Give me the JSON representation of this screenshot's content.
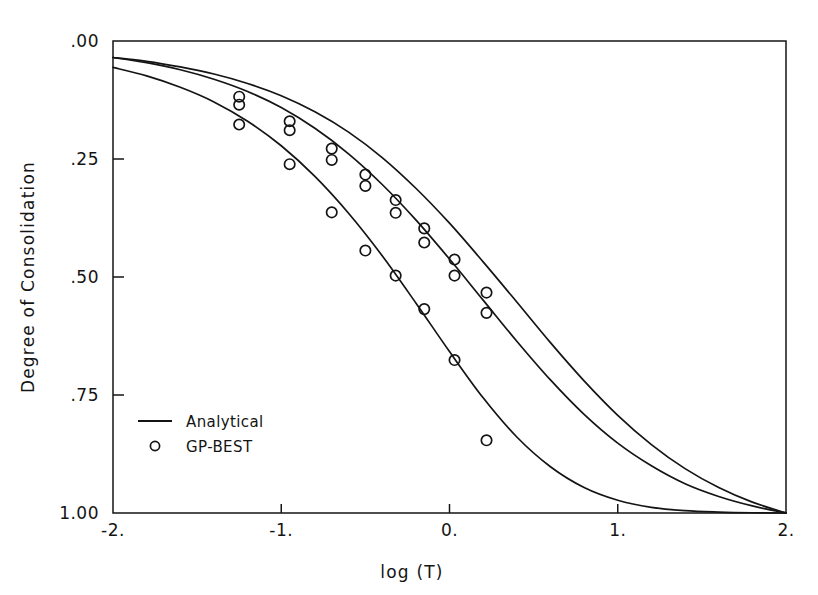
{
  "chart_data": {
    "type": "line",
    "title": "",
    "subtitle": "",
    "xlabel": "log (T)",
    "ylabel": "Degree of Consolidation",
    "xlim": [
      -2,
      2
    ],
    "ylim": [
      0,
      1
    ],
    "y_axis_inverted": true,
    "grid": false,
    "xticks": [
      -2,
      -1,
      0,
      1,
      2
    ],
    "xticklabels": [
      "-2.",
      "-1.",
      "0.",
      "1.",
      "2."
    ],
    "yticks": [
      0,
      0.25,
      0.5,
      0.75,
      1
    ],
    "yticklabels": [
      ".00",
      ".25",
      ".50",
      ".75",
      "1.00"
    ],
    "legend": {
      "position": "lower-left-inside",
      "entries": [
        {
          "label": "Analytical",
          "marker": "line"
        },
        {
          "label": "GP-BEST",
          "marker": "circle"
        }
      ]
    },
    "annotations": [],
    "series": [
      {
        "name": "Analytical",
        "kind": "line",
        "curve_index": 1,
        "x": [
          -2.0,
          -1.8,
          -1.6,
          -1.4,
          -1.2,
          -1.0,
          -0.8,
          -0.6,
          -0.4,
          -0.2,
          0.0,
          0.2,
          0.4,
          0.6,
          0.8,
          1.0,
          1.2,
          1.4,
          1.6,
          1.8,
          2.0
        ],
        "y": [
          0.035,
          0.046,
          0.061,
          0.081,
          0.107,
          0.141,
          0.185,
          0.239,
          0.304,
          0.379,
          0.462,
          0.549,
          0.636,
          0.718,
          0.791,
          0.852,
          0.9,
          0.938,
          0.965,
          0.985,
          1.0
        ]
      },
      {
        "name": "Analytical",
        "kind": "line",
        "curve_index": 2,
        "x": [
          -2.0,
          -1.8,
          -1.6,
          -1.4,
          -1.2,
          -1.0,
          -0.8,
          -0.6,
          -0.4,
          -0.2,
          0.0,
          0.2,
          0.4,
          0.6,
          0.8,
          1.0,
          1.2,
          1.4,
          1.6,
          1.8,
          2.0
        ],
        "y": [
          0.035,
          0.043,
          0.055,
          0.07,
          0.09,
          0.116,
          0.15,
          0.193,
          0.247,
          0.312,
          0.386,
          0.468,
          0.553,
          0.639,
          0.72,
          0.793,
          0.855,
          0.906,
          0.946,
          0.977,
          1.0
        ]
      },
      {
        "name": "Analytical",
        "kind": "line",
        "curve_index": 3,
        "x": [
          -2.0,
          -1.8,
          -1.6,
          -1.4,
          -1.2,
          -1.0,
          -0.8,
          -0.6,
          -0.4,
          -0.2,
          0.0,
          0.2,
          0.4,
          0.6,
          0.8,
          1.0,
          1.2,
          1.4,
          1.6,
          1.8,
          2.0
        ],
        "y": [
          0.056,
          0.074,
          0.098,
          0.129,
          0.17,
          0.222,
          0.287,
          0.365,
          0.455,
          0.555,
          0.658,
          0.756,
          0.839,
          0.902,
          0.946,
          0.973,
          0.988,
          0.995,
          0.998,
          0.9995,
          1.0
        ]
      },
      {
        "name": "GP-BEST",
        "kind": "scatter",
        "curve_index": 1,
        "x": [
          -1.25,
          -0.95,
          -0.7,
          -0.5,
          -0.32,
          -0.15,
          0.03,
          0.22
        ],
        "y": [
          0.118,
          0.17,
          0.228,
          0.283,
          0.337,
          0.397,
          0.463,
          0.533
        ]
      },
      {
        "name": "GP-BEST",
        "kind": "scatter",
        "curve_index": 2,
        "x": [
          -1.25,
          -0.95,
          -0.7,
          -0.5,
          -0.32,
          -0.15,
          0.03,
          0.22
        ],
        "y": [
          0.135,
          0.189,
          0.252,
          0.307,
          0.364,
          0.427,
          0.497,
          0.576
        ]
      },
      {
        "name": "GP-BEST",
        "kind": "scatter",
        "curve_index": 3,
        "x": [
          -1.25,
          -0.95,
          -0.7,
          -0.5,
          -0.32,
          -0.15,
          0.03,
          0.22
        ],
        "y": [
          0.177,
          0.261,
          0.363,
          0.444,
          0.497,
          0.568,
          0.676,
          0.846
        ]
      }
    ]
  },
  "axes": {
    "x_title": "log (T)",
    "y_title": "Degree of Consolidation"
  },
  "legend": {
    "analytical_label": "Analytical",
    "gpbest_label": "GP-BEST"
  },
  "colors": {
    "ink": "#141414",
    "background": "#ffffff"
  }
}
